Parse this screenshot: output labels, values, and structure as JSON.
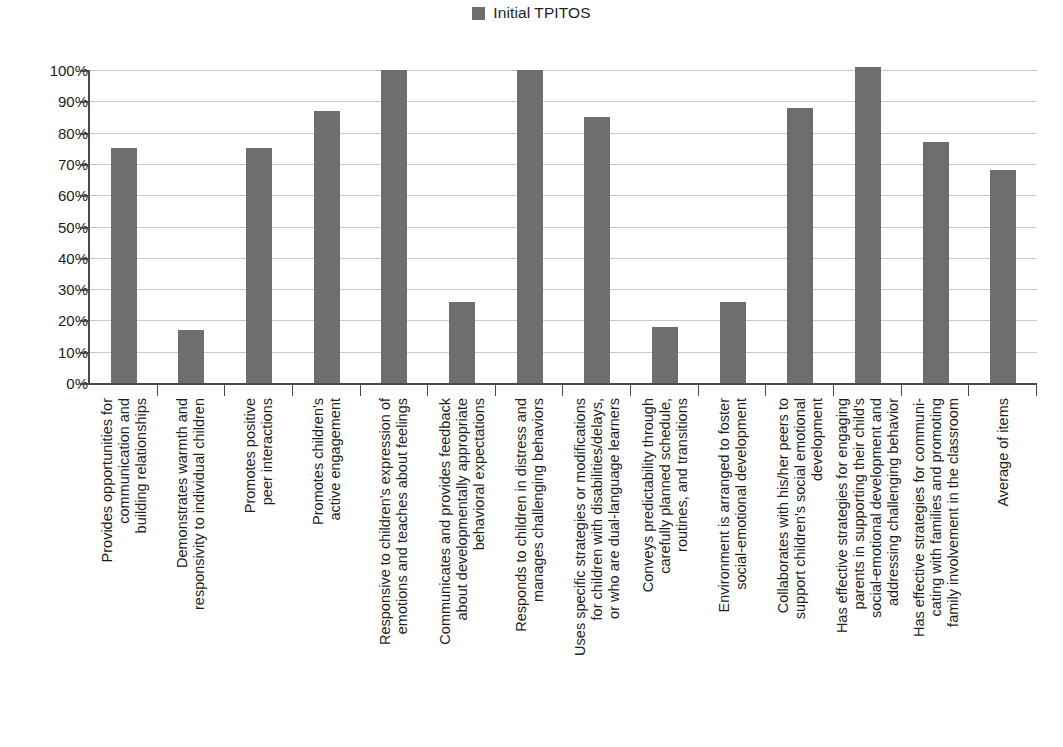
{
  "legend": {
    "entries": [
      {
        "label": "Initial TPITOS",
        "color": "#6e6e6e",
        "swatch_icon": "legend-square-icon"
      }
    ],
    "position": "top-center"
  },
  "axes": {
    "y_ticks": [
      "0%",
      "10%",
      "20%",
      "30%",
      "40%",
      "50%",
      "60%",
      "70%",
      "80%",
      "90%",
      "100%"
    ],
    "y_min": 0,
    "y_max": 100,
    "y_step": 10,
    "grid": "horizontal"
  },
  "chart_data": {
    "type": "bar",
    "title": "",
    "subtitle": "",
    "xlabel": "",
    "ylabel": "",
    "ylim": [
      0,
      100
    ],
    "ytick_labels": [
      "0%",
      "10%",
      "20%",
      "30%",
      "40%",
      "50%",
      "60%",
      "70%",
      "80%",
      "90%",
      "100%"
    ],
    "grid": true,
    "legend_position": "top-center",
    "series": [
      {
        "name": "Initial TPITOS",
        "color": "#6e6e6e",
        "values": [
          75,
          17,
          75,
          87,
          100,
          26,
          100,
          85,
          18,
          26,
          88,
          101,
          77,
          68
        ]
      }
    ],
    "categories": [
      "Provides opportunities for communication and building relationships",
      "Demonstrates warmth and responsivity to individual children",
      "Promotes positive peer interactions",
      "Promotes children's active engagement",
      "Responsive to children's expression of emotions and teaches about feelings",
      "Communicates and provides feedback about developmentally appropriate behavioral expectations",
      "Responds to children in distress and manages challenging behaviors",
      "Uses specific strategies or modifications for children with disabilities/delays, or who are dual-language learners",
      "Conveys predictability through carefully planned schedule, routines, and transitions",
      "Environment is arranged to foster social-emotional development",
      "Collaborates with his/her peers to support children's social emotional development",
      "Has effective strategies for engaging parents in supporting their child's social-emotional development and addressing challenging behavior",
      "Has effective strategies for communi-cating with families and promoting family involvement in the classroom",
      "Average of items"
    ],
    "category_lines": [
      [
        "Provides opportunities for",
        "communication and",
        "building relationships"
      ],
      [
        "Demonstrates warmth and",
        "responsivity to individual children"
      ],
      [
        "Promotes positive",
        "peer interactions"
      ],
      [
        "Promotes children's",
        "active engagement"
      ],
      [
        "Responsive to children's expression of",
        "emotions and teaches about feelings"
      ],
      [
        "Communicates and provides feedback",
        "about developmentally appropriate",
        "behavioral expectations"
      ],
      [
        "Responds to children in distress and",
        "manages challenging behaviors"
      ],
      [
        "Uses specific strategies or modifications",
        "for children with disabilities/delays,",
        "or who are dual-language learners"
      ],
      [
        "Conveys predictability through",
        "carefully planned schedule,",
        "routines, and transitions"
      ],
      [
        "Environment is arranged to foster",
        "social-emotional development"
      ],
      [
        "Collaborates with his/her peers to",
        "support children's social emotional",
        "development"
      ],
      [
        "Has effective strategies for engaging",
        "parents in supporting their child's",
        "social-emotional development and",
        "addressing challenging behavior"
      ],
      [
        "Has effective strategies for communi-",
        "cating with families and promoting",
        "family involvement in the classroom"
      ],
      [
        "Average of items"
      ]
    ]
  },
  "colors": {
    "bar": "#6e6e6e",
    "axis": "#4a4a4a",
    "gridline": "#c8c8c8",
    "text": "#1d1d1d",
    "background": "#ffffff"
  }
}
